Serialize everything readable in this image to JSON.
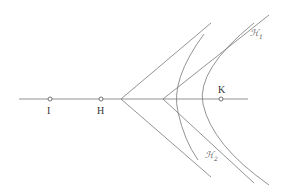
{
  "diagram": {
    "points": [
      {
        "id": "I",
        "label": "I",
        "x": 50,
        "y": 99
      },
      {
        "id": "H",
        "label": "H",
        "x": 101,
        "y": 99
      },
      {
        "id": "K",
        "label": "K",
        "x": 221,
        "y": 99
      }
    ],
    "curves": [
      {
        "id": "H1",
        "label": "ℋ",
        "subscript": "1"
      },
      {
        "id": "H2",
        "label": "ℋ",
        "subscript": "2"
      }
    ],
    "colors": {
      "stroke": "#666666",
      "text": "#333333"
    }
  }
}
